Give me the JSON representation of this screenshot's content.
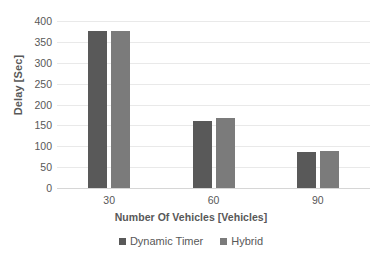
{
  "chart_data": {
    "type": "bar",
    "title": "",
    "xlabel": "Number Of Vehicles [Vehicles]",
    "ylabel": "Delay [Sec]",
    "categories": [
      "30",
      "60",
      "90"
    ],
    "series": [
      {
        "name": "Dynamic Timer",
        "values": [
          375,
          160,
          87
        ],
        "color": "#595959"
      },
      {
        "name": "Hybrid",
        "values": [
          375,
          168,
          88
        ],
        "color": "#7b7b7b"
      }
    ],
    "ylim": [
      0,
      400
    ],
    "ytick_step": 50,
    "yticks": [
      "400",
      "350",
      "300",
      "250",
      "200",
      "150",
      "100",
      "50",
      "0"
    ],
    "xticks": [
      "30",
      "60",
      "90"
    ],
    "grid": true,
    "grid_color": "#e9e9e9",
    "legend_position": "bottom",
    "text_color": "#585858",
    "background": "#ffffff"
  },
  "legend": {
    "items": [
      {
        "label": "Dynamic Timer",
        "swatch_name": "legend-swatch-dynamic-timer"
      },
      {
        "label": "Hybrid",
        "swatch_name": "legend-swatch-hybrid"
      }
    ]
  }
}
